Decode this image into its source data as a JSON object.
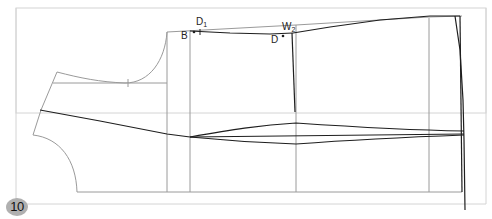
{
  "figure": {
    "number_badge": "10",
    "colors": {
      "frame": "#d4d4d4",
      "guide": "#9a9a9a",
      "pattern": "#1e1e1e",
      "badge_bg": "#b0b0b0"
    }
  },
  "labels": {
    "D1": {
      "main": "D",
      "sub": "1"
    },
    "B": {
      "main": "B"
    },
    "W2": {
      "main": "W",
      "sub": "2"
    },
    "D": {
      "main": "D"
    }
  }
}
